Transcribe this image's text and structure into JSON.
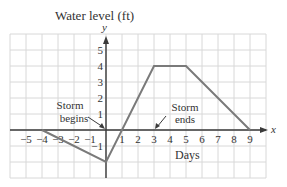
{
  "chart_data": {
    "type": "line",
    "title": "Water level (ft)",
    "xlabel": "Days",
    "ylabel": "y",
    "x_axis_letter": "x",
    "y_axis_letter": "y",
    "xlim": [
      -6,
      10
    ],
    "ylim": [
      -3,
      6
    ],
    "grid": true,
    "x_ticks": [
      -5,
      -4,
      -3,
      -2,
      -1,
      1,
      2,
      3,
      4,
      5,
      6,
      7,
      8,
      9
    ],
    "x_tick_labels": [
      "−5",
      "−4",
      "−3",
      "−2",
      "−1",
      "1",
      "2",
      "3",
      "4",
      "5",
      "6",
      "7",
      "8",
      "9"
    ],
    "y_ticks": [
      -1,
      1,
      2,
      3,
      4,
      5
    ],
    "y_tick_labels": [
      "−1",
      "1",
      "2",
      "3",
      "4",
      "5"
    ],
    "series": [
      {
        "name": "Water level",
        "x": [
          -4,
          0,
          3,
          5,
          9
        ],
        "y": [
          0,
          -2,
          4,
          4,
          0
        ]
      }
    ],
    "annotations": [
      {
        "text_line1": "Storm",
        "text_line2": "begins",
        "points_to": [
          0,
          0
        ]
      },
      {
        "text_line1": "Storm",
        "text_line2": "ends",
        "points_to": [
          3,
          0
        ]
      }
    ]
  },
  "colors": {
    "line": "#7a7a7a",
    "grid": "#d8d8d8",
    "axis": "#3a3a3a",
    "text": "#333333"
  }
}
